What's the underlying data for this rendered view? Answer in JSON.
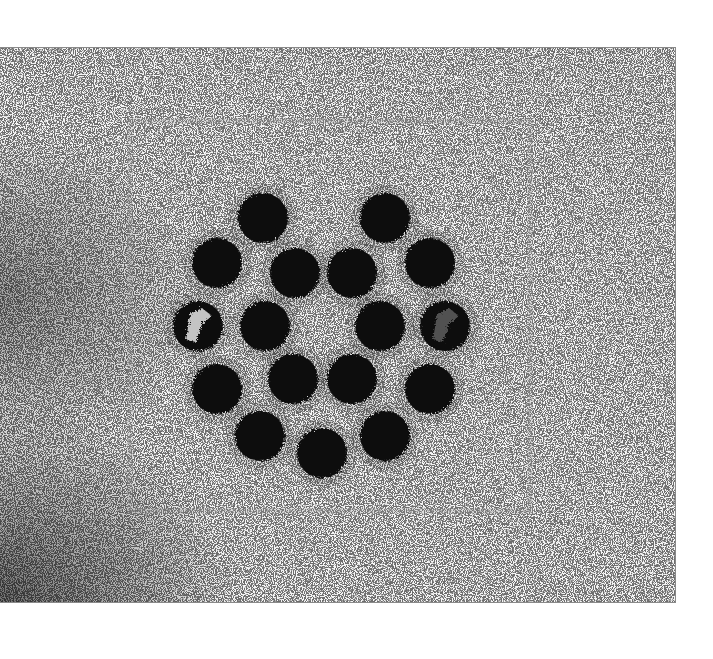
{
  "image": {
    "description": "Grainy black-and-white micrograph-like texture with an arrangement of dark circular dots in two concentric rings",
    "frame": {
      "x": 0,
      "y": 47,
      "width": 676,
      "height": 556
    },
    "colors": {
      "background": "#f6f6f6",
      "dots": "#0a0a0a",
      "speckle": "#1a1a1a",
      "border": "#8a8a8a"
    },
    "dot_radius": 25,
    "outer_ring": [
      {
        "cx": 263,
        "cy": 217
      },
      {
        "cx": 385,
        "cy": 217
      },
      {
        "cx": 217,
        "cy": 262
      },
      {
        "cx": 430,
        "cy": 262
      },
      {
        "cx": 198,
        "cy": 325,
        "note": "partially light interior"
      },
      {
        "cx": 445,
        "cy": 325,
        "note": "partially light interior"
      },
      {
        "cx": 217,
        "cy": 388
      },
      {
        "cx": 430,
        "cy": 388
      },
      {
        "cx": 260,
        "cy": 435
      },
      {
        "cx": 385,
        "cy": 435
      },
      {
        "cx": 322,
        "cy": 452
      }
    ],
    "inner_ring": [
      {
        "cx": 295,
        "cy": 272
      },
      {
        "cx": 352,
        "cy": 272
      },
      {
        "cx": 265,
        "cy": 325
      },
      {
        "cx": 380,
        "cy": 325
      },
      {
        "cx": 293,
        "cy": 378
      },
      {
        "cx": 352,
        "cy": 378
      }
    ]
  }
}
